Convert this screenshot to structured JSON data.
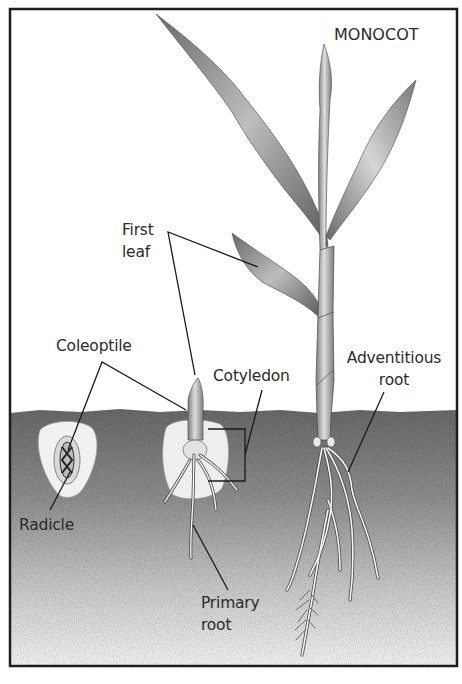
{
  "title": "MONOCOT",
  "labels": {
    "first_leaf": [
      "First",
      "leaf"
    ],
    "coleoptile": "Coleoptile",
    "cotyledon": "Cotyledon",
    "adventitious_root": [
      "Adventitious",
      "root"
    ],
    "radicle": "Radicle",
    "primary_root": [
      "Primary",
      "root"
    ]
  },
  "stages": [
    {
      "name": "seed",
      "parts": [
        "Coleoptile",
        "Radicle"
      ]
    },
    {
      "name": "seedling",
      "parts": [
        "First leaf",
        "Coleoptile",
        "Cotyledon",
        "Primary root"
      ]
    },
    {
      "name": "young plant",
      "parts": [
        "First leaf",
        "Adventitious root"
      ]
    }
  ],
  "colors": {
    "frame": "#1e1e1e",
    "sky": "#ffffff",
    "soil_top": "#6e6e6e",
    "soil_bottom": "#efefef",
    "leader_line": "#1a1a1a",
    "text": "#2b2b2b"
  }
}
